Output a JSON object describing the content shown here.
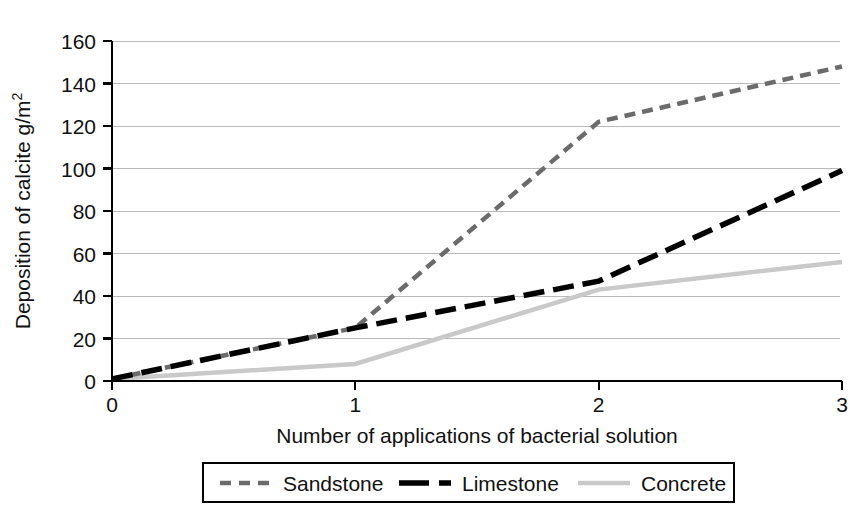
{
  "chart_data": {
    "type": "line",
    "title": "",
    "xlabel": "Number of applications of bacterial solution",
    "ylabel": "Deposition of calcite g/m",
    "ylabel_superscript": "2",
    "x": [
      0,
      1,
      2,
      3
    ],
    "xlim": [
      0,
      3
    ],
    "ylim": [
      0,
      160
    ],
    "xticks": [
      "0",
      "1",
      "2",
      "3"
    ],
    "yticks": [
      "0",
      "20",
      "40",
      "60",
      "80",
      "100",
      "120",
      "140",
      "160"
    ],
    "grid": "horizontal",
    "legend_position": "bottom-center",
    "series": [
      {
        "name": "Sandstone",
        "values": [
          1,
          25,
          122,
          148
        ],
        "color": "#6b6b6b",
        "line_style": "dashed",
        "dash_pattern": "11,7",
        "width": 4.5
      },
      {
        "name": "Limestone",
        "values": [
          1,
          25,
          47,
          99
        ],
        "color": "#000000",
        "line_style": "long-dashed",
        "dash_pattern": "21,9",
        "width": 5.5
      },
      {
        "name": "Concrete",
        "values": [
          1,
          8,
          43,
          56
        ],
        "color": "#c9c9c9",
        "line_style": "solid",
        "dash_pattern": "none",
        "width": 4.5
      }
    ]
  },
  "legend": {
    "entries": [
      {
        "label": "Sandstone",
        "swatch": "dashed-gray-swatch"
      },
      {
        "label": "Limestone",
        "swatch": "dashed-black-swatch"
      },
      {
        "label": "Concrete",
        "swatch": "solid-lightgray-swatch"
      }
    ]
  },
  "axes": {
    "y_tick_0": "0",
    "y_tick_20": "20",
    "y_tick_40": "40",
    "y_tick_60": "60",
    "y_tick_80": "80",
    "y_tick_100": "100",
    "y_tick_120": "120",
    "y_tick_140": "140",
    "y_tick_160": "160",
    "x_tick_0": "0",
    "x_tick_1": "1",
    "x_tick_2": "2",
    "x_tick_3": "3",
    "x_axis_title": "Number of applications of bacterial solution",
    "y_axis_title_main": "Deposition of calcite g/m",
    "y_axis_title_sup": "2"
  }
}
